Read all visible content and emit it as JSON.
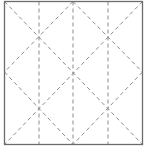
{
  "diagram": {
    "type": "crease-pattern",
    "square": {
      "x": 4.5,
      "y": 1.5,
      "w": 138,
      "h": 143,
      "stroke": "#6b6b6b"
    },
    "dash_color": "#8c8c8c",
    "vertical_lines_x": [
      39,
      73,
      108
    ],
    "diagonals": [
      [
        4.5,
        1.5,
        142.5,
        144.5
      ],
      [
        73,
        1.5,
        142.5,
        72
      ],
      [
        4.5,
        72,
        73,
        144.5
      ],
      [
        73,
        1.5,
        4.5,
        72
      ],
      [
        142.5,
        72,
        73,
        144.5
      ],
      [
        142.5,
        1.5,
        4.5,
        144.5
      ]
    ]
  }
}
